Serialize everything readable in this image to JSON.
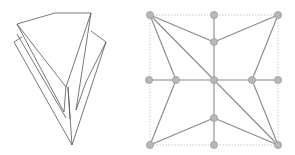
{
  "colors": {
    "background": "#ffffff",
    "fold_stroke": "#555555",
    "grid_edge": "#8a8a8a",
    "border_dash": "#bbbbbb",
    "node_fill": "#b8b8b8",
    "node_stroke": "#999999"
  },
  "left_figure": {
    "description": "folded paper (origami) 3D model",
    "polylines": [
      [
        [
          17,
          24
        ],
        [
          55,
          13
        ],
        [
          91,
          13
        ],
        [
          66,
          87
        ],
        [
          17,
          24
        ]
      ],
      [
        [
          17,
          24
        ],
        [
          64,
          112
        ],
        [
          66,
          87
        ]
      ],
      [
        [
          14,
          42
        ],
        [
          22,
          37
        ]
      ],
      [
        [
          14,
          42
        ],
        [
          72,
          145
        ],
        [
          68,
          87
        ]
      ],
      [
        [
          91,
          13
        ],
        [
          76,
          110
        ],
        [
          86,
          82
        ],
        [
          106,
          42
        ],
        [
          91,
          31
        ]
      ],
      [
        [
          106,
          42
        ],
        [
          72,
          145
        ]
      ],
      [
        [
          68,
          87
        ],
        [
          70,
          119
        ]
      ],
      [
        [
          17,
          34
        ],
        [
          66,
          118
        ]
      ]
    ]
  },
  "right_figure": {
    "description": "crease pattern with nodes",
    "border": {
      "x": 150,
      "y": 15,
      "w": 128,
      "h": 130
    },
    "nodes": [
      [
        150,
        15
      ],
      [
        214,
        15
      ],
      [
        278,
        15
      ],
      [
        214,
        42
      ],
      [
        149,
        80
      ],
      [
        176,
        80
      ],
      [
        214,
        80
      ],
      [
        252,
        80
      ],
      [
        278,
        80
      ],
      [
        214,
        118
      ],
      [
        150,
        145
      ],
      [
        214,
        145
      ],
      [
        278,
        145
      ]
    ],
    "edges": [
      [
        0,
        3
      ],
      [
        3,
        2
      ],
      [
        1,
        3
      ],
      [
        3,
        6
      ],
      [
        0,
        5
      ],
      [
        0,
        6
      ],
      [
        4,
        5
      ],
      [
        5,
        6
      ],
      [
        6,
        7
      ],
      [
        7,
        8
      ],
      [
        5,
        10
      ],
      [
        2,
        7
      ],
      [
        7,
        12
      ],
      [
        6,
        12
      ],
      [
        6,
        9
      ],
      [
        9,
        11
      ],
      [
        10,
        9
      ],
      [
        9,
        12
      ]
    ]
  }
}
